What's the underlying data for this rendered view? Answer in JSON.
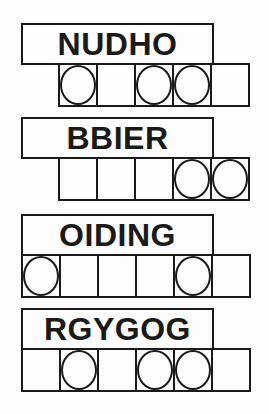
{
  "puzzle": {
    "colors": {
      "line": "#1a1a1a",
      "background": "#fdfdfd"
    },
    "items": [
      {
        "word": "NUDHO",
        "cells": 5,
        "circles": [
          1,
          3,
          4
        ]
      },
      {
        "word": "BBIER",
        "cells": 5,
        "circles": [
          4,
          5
        ]
      },
      {
        "word": "OIDING",
        "cells": 6,
        "circles": [
          1,
          5
        ]
      },
      {
        "word": "RGYGOG",
        "cells": 6,
        "circles": [
          2,
          4,
          5
        ]
      }
    ]
  }
}
